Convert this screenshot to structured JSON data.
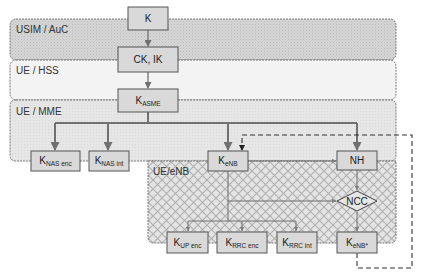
{
  "diagram": {
    "regions": [
      {
        "id": "usim",
        "label": "USIM / AuC"
      },
      {
        "id": "hss",
        "label": "UE / HSS"
      },
      {
        "id": "mme",
        "label": "UE / MME"
      },
      {
        "id": "enb",
        "label": "UE/eNB"
      }
    ],
    "nodes": {
      "k": {
        "main": "K",
        "sub": ""
      },
      "ckik": {
        "main": "CK, IK",
        "sub": ""
      },
      "kasme": {
        "main": "K",
        "sub": "ASME"
      },
      "knasenc": {
        "main": "K",
        "sub": "NAS enc"
      },
      "knasint": {
        "main": "K",
        "sub": "NAS int"
      },
      "kenb": {
        "main": "K",
        "sub": "eNB"
      },
      "nh": {
        "main": "NH",
        "sub": ""
      },
      "ncc": {
        "main": "NCC",
        "sub": ""
      },
      "kupenc": {
        "main": "K",
        "sub": "UP enc"
      },
      "krrcenc": {
        "main": "K",
        "sub": "RRC enc"
      },
      "krrcint": {
        "main": "K",
        "sub": "RRC int"
      },
      "kenbstar": {
        "main": "K",
        "sub": "eNB*"
      }
    },
    "edges": [
      {
        "from": "K",
        "to": "CK, IK"
      },
      {
        "from": "CK, IK",
        "to": "K_ASME"
      },
      {
        "from": "K_ASME",
        "to": "K_NAS enc"
      },
      {
        "from": "K_ASME",
        "to": "K_NAS int"
      },
      {
        "from": "K_ASME",
        "to": "K_eNB"
      },
      {
        "from": "K_ASME",
        "to": "NH"
      },
      {
        "from": "K_eNB",
        "to": "NH"
      },
      {
        "from": "K_eNB",
        "to": "NCC"
      },
      {
        "from": "K_eNB",
        "to": "K_UP enc"
      },
      {
        "from": "K_eNB",
        "to": "K_RRC enc"
      },
      {
        "from": "K_eNB",
        "to": "K_RRC int"
      },
      {
        "from": "NH",
        "to": "NCC"
      },
      {
        "from": "NCC",
        "to": "K_eNB*"
      },
      {
        "from": "K_eNB*",
        "to": "K_eNB",
        "style": "dashed"
      }
    ],
    "colors": {
      "box_fill": "#d9d9d9",
      "box_stroke": "#555555",
      "edge": "#707070",
      "usim_fill": "#d4d4d4",
      "hss_fill": "#f2f2f2",
      "mme_fill": "#e6e6e6",
      "enb_hatch": "#b5b5b5"
    }
  }
}
